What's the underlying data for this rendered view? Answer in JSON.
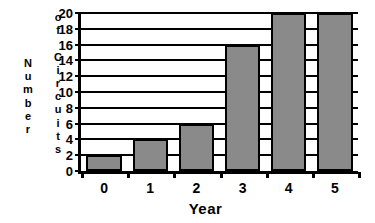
{
  "chart_data": {
    "type": "bar",
    "title": "",
    "xlabel": "Year",
    "ylabel": "Number of Circuits",
    "ylabel_lines": [
      "Number",
      "of Circuits"
    ],
    "categories": [
      "0",
      "1",
      "2",
      "3",
      "4",
      "5"
    ],
    "values": [
      2,
      4,
      6,
      16,
      20,
      20
    ],
    "ylim": [
      0,
      20
    ],
    "yticks": [
      0,
      2,
      4,
      6,
      8,
      10,
      12,
      14,
      16,
      18,
      20
    ],
    "ytick_labels": [
      "0",
      "2",
      "4",
      "6",
      "8",
      "10",
      "12",
      "14",
      "16",
      "18",
      "20"
    ],
    "xtick_labels": [
      "0",
      "1",
      "2",
      "3",
      "4",
      "5"
    ],
    "grid": "horizontal",
    "legend": "none",
    "bar_fill": "#bfbfbf",
    "bar_edge": "#000000",
    "axis_color": "#000000"
  },
  "axis_titles": {
    "y_column_1": "Number",
    "y_column_2": "of Circuits",
    "x": "Year"
  }
}
